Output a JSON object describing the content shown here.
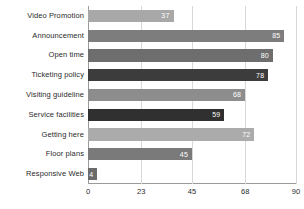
{
  "chart_data": {
    "type": "bar",
    "orientation": "horizontal",
    "title": "",
    "subtitle": "",
    "xlabel": "",
    "ylabel": "",
    "xlim": [
      0,
      90
    ],
    "grid": true,
    "legend": false,
    "xticks": [
      "0",
      "23",
      "45",
      "68",
      "90"
    ],
    "xtick_values": [
      0,
      23,
      45,
      68,
      90
    ],
    "categories": [
      "Video Promotion",
      "Announcement",
      "Open time",
      "Ticketing policy",
      "Visiting guideline",
      "Service facilities",
      "Getting here",
      "Floor plans",
      "Responsive Web"
    ],
    "values": [
      37,
      85,
      80,
      78,
      68,
      59,
      72,
      45,
      4
    ],
    "value_labels": [
      "37",
      "85",
      "80",
      "78",
      "68",
      "59",
      "72",
      "45",
      "4"
    ],
    "bar_colors": [
      "#a8a8a8",
      "#7d7d7d",
      "#6e6e6e",
      "#3c3c3c",
      "#8d8d8d",
      "#303030",
      "#ababab",
      "#7a7a7a",
      "#6b6b6b"
    ]
  }
}
